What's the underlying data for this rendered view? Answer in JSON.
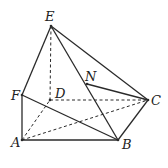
{
  "figure": {
    "type": "geometry-solid",
    "points": {
      "E": {
        "x": 51,
        "y": 26,
        "label": "E",
        "lx": 45,
        "ly": 21
      },
      "F": {
        "x": 22,
        "y": 95,
        "label": "F",
        "lx": 11,
        "ly": 100
      },
      "D": {
        "x": 50,
        "y": 100,
        "label": "D",
        "lx": 55,
        "ly": 98
      },
      "N": {
        "x": 87,
        "y": 84,
        "label": "N",
        "lx": 85,
        "ly": 81
      },
      "C": {
        "x": 148,
        "y": 100,
        "label": "C",
        "lx": 151,
        "ly": 105
      },
      "A": {
        "x": 22,
        "y": 140,
        "label": "A",
        "lx": 11,
        "ly": 147
      },
      "B": {
        "x": 118,
        "y": 140,
        "label": "B",
        "lx": 122,
        "ly": 149
      }
    },
    "solid_edges": [
      [
        "E",
        "F"
      ],
      [
        "E",
        "C"
      ],
      [
        "E",
        "B"
      ],
      [
        "F",
        "A"
      ],
      [
        "F",
        "B"
      ],
      [
        "A",
        "B"
      ],
      [
        "B",
        "C"
      ],
      [
        "N",
        "C"
      ]
    ],
    "dashed_edges": [
      [
        "E",
        "D"
      ],
      [
        "D",
        "C"
      ],
      [
        "A",
        "D"
      ],
      [
        "A",
        "C"
      ]
    ],
    "stroke_color": "#2a2a2a"
  }
}
